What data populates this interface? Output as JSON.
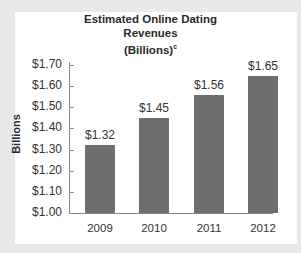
{
  "chart_data": {
    "type": "bar",
    "title": "Estimated Online Dating Revenues (Billions)",
    "title_lines": [
      "Estimated Online Dating",
      "Revenues",
      "(Billions)"
    ],
    "title_superscript": "c",
    "xlabel": "",
    "ylabel": "Billions",
    "categories": [
      "2009",
      "2010",
      "2011",
      "2012"
    ],
    "values": [
      1.32,
      1.45,
      1.56,
      1.65
    ],
    "value_labels": [
      "$1.32",
      "$1.45",
      "$1.56",
      "$1.65"
    ],
    "ylim": [
      1.0,
      1.7
    ],
    "yticks": [
      "$1.00",
      "$1.10",
      "$1.20",
      "$1.30",
      "$1.40",
      "$1.50",
      "$1.60",
      "$1.70"
    ],
    "grid": false,
    "legend": null,
    "bar_color": "#6e6e6e"
  }
}
